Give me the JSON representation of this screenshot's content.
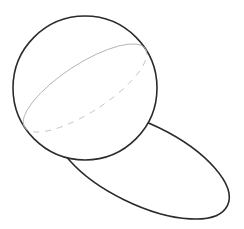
{
  "diagram": {
    "colors": {
      "background": "#ffffff",
      "outline": "#2b2b2b",
      "great_circle_front": "#b4b4b4",
      "great_circle_back": "#c4c4c4"
    },
    "sphere": {
      "cx": 85,
      "cy": 88,
      "r": 72,
      "stroke_width": 1.6
    },
    "great_circle": {
      "cx": 85,
      "cy": 88,
      "rx": 72,
      "ry": 24,
      "rotation_deg": -33,
      "front_style": "solid",
      "back_style": "dashed",
      "dash": "6 6"
    },
    "shadow_ellipse": {
      "cx": 142,
      "cy": 164,
      "rx": 95,
      "ry": 40,
      "rotation_deg": 26,
      "stroke_width": 1.6
    }
  }
}
